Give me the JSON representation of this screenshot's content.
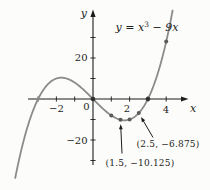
{
  "figure": {
    "background_color": "#fcfcfa",
    "axis_color": "#1c1c1c",
    "curve_color": "#8b8b8b",
    "point_color": "#5a5a5a",
    "root_point_color": "#303030",
    "text_color": "#1c1c1c"
  },
  "chart_data": {
    "type": "line",
    "title_parts": {
      "lead": "y = x",
      "sup": "3",
      "tail": " − 9x"
    },
    "function": "y = x^3 − 9x",
    "coefficients": {
      "a3": 1,
      "a1": -9
    },
    "xlabel": "x",
    "ylabel": "y",
    "x_drawn_range": [
      -4.25,
      4.37
    ],
    "xlim": [
      -3.5,
      5.1
    ],
    "ylim": [
      -45,
      44
    ],
    "grid": false,
    "x_tick_step": 1,
    "x_ticks": [
      -3,
      -2,
      -1,
      1,
      2,
      3,
      4
    ],
    "y_tick_step": 10,
    "y_ticks": [
      -30,
      -20,
      -10,
      10,
      20,
      30
    ],
    "x_tick_labels": [
      {
        "value": -2,
        "text": "−2"
      },
      {
        "value": 0,
        "text": "0"
      },
      {
        "value": 2,
        "text": "2"
      },
      {
        "value": 4,
        "text": "4"
      }
    ],
    "y_tick_labels": [
      {
        "value": 20,
        "text": "20"
      },
      {
        "value": -20,
        "text": "−20"
      }
    ],
    "curve_points": [
      [
        -4,
        -28
      ],
      [
        -3.5,
        -11.375
      ],
      [
        -3,
        0
      ],
      [
        -2.5,
        6.875
      ],
      [
        -2,
        10
      ],
      [
        -1.5,
        10.125
      ],
      [
        -1,
        8
      ],
      [
        -0.5,
        4.375
      ],
      [
        0,
        0
      ],
      [
        0.5,
        -4.375
      ],
      [
        1,
        -8
      ],
      [
        1.5,
        -10.125
      ],
      [
        2,
        -10
      ],
      [
        2.5,
        -6.875
      ],
      [
        3,
        0
      ],
      [
        3.5,
        11.375
      ],
      [
        4,
        28
      ]
    ],
    "marked_points": [
      {
        "x": 0,
        "y": 0,
        "root": true
      },
      {
        "x": 1,
        "y": -8,
        "root": false
      },
      {
        "x": 1.5,
        "y": -10.125,
        "root": false
      },
      {
        "x": 2,
        "y": -10,
        "root": false
      },
      {
        "x": 2.5,
        "y": -6.875,
        "root": false
      },
      {
        "x": 3,
        "y": 0,
        "root": true
      },
      {
        "x": 4,
        "y": 28,
        "root": false
      }
    ],
    "annotations": [
      {
        "text": "(2.5, −6.875)",
        "target": [
          2.5,
          -6.875
        ]
      },
      {
        "text": "(1.5, −10.125)",
        "target": [
          1.5,
          -10.125
        ]
      }
    ]
  }
}
